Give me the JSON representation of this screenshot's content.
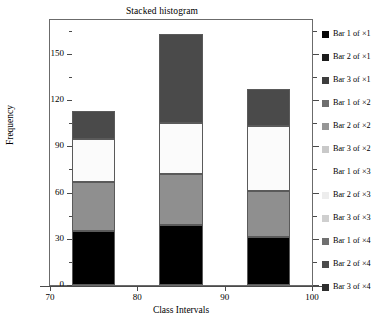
{
  "chart_data": {
    "type": "bar",
    "subtype": "stacked-histogram",
    "title": "Stacked histogram",
    "xlabel": "Class Intervals",
    "ylabel": "Frequency",
    "xlim": [
      70,
      100
    ],
    "ylim": [
      0,
      172
    ],
    "xticks": [
      70,
      80,
      90,
      100
    ],
    "yticks": [
      0,
      30,
      60,
      90,
      120,
      150
    ],
    "grid": false,
    "legend_position": "right",
    "categories": [
      "72.5-77.5",
      "82.5-87.5",
      "92.5-97.5"
    ],
    "bar_edges": [
      [
        72.5,
        77.5
      ],
      [
        82.5,
        87.5
      ],
      [
        92.5,
        97.5
      ]
    ],
    "series": [
      {
        "name": "segment-1",
        "values": [
          35,
          39,
          31
        ],
        "color": "#000000"
      },
      {
        "name": "segment-2",
        "values": [
          32,
          33,
          30
        ],
        "color": "#8f8f8f"
      },
      {
        "name": "segment-3",
        "values": [
          28,
          33,
          42
        ],
        "color": "#fbfbfb"
      },
      {
        "name": "segment-4",
        "values": [
          18,
          58,
          24
        ],
        "color": "#4a4a4a"
      }
    ],
    "bar_totals": [
      113,
      163,
      127
    ],
    "legend_entries": [
      {
        "label": "Bar 1 of  ×1",
        "color": "#050505"
      },
      {
        "label": "Bar 2 of  ×1",
        "color": "#1c1c1c"
      },
      {
        "label": "Bar 3 of  ×1",
        "color": "#3d3d3d"
      },
      {
        "label": "Bar 1 of  ×2",
        "color": "#6e6e6e"
      },
      {
        "label": "Bar 2 of  ×2",
        "color": "#969696"
      },
      {
        "label": "Bar 3 of  ×2",
        "color": "#c9c9c9"
      },
      {
        "label": "Bar 1 of  ×3",
        "color": "#ffffff"
      },
      {
        "label": "Bar 2 of  ×3",
        "color": "#ededed"
      },
      {
        "label": "Bar 3 of  ×3",
        "color": "#cfcfcf"
      },
      {
        "label": "Bar 1 of  ×4",
        "color": "#707070"
      },
      {
        "label": "Bar 2 of  ×4",
        "color": "#4b4b4b"
      },
      {
        "label": "Bar 3 of  ×4",
        "color": "#2e2e2e"
      }
    ]
  },
  "axis": {
    "ytick_labels": [
      "150",
      "120",
      "90",
      "60",
      "30",
      "0"
    ],
    "xtick_labels": [
      "70",
      "80",
      "90",
      "100"
    ]
  },
  "artifact": {
    "text": ""
  }
}
